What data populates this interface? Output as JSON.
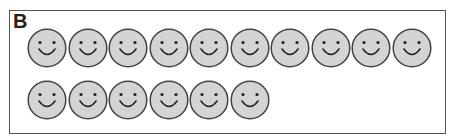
{
  "panel": {
    "label": "B",
    "rows": [
      {
        "count": 10
      },
      {
        "count": 6
      }
    ],
    "total": 16,
    "icon": "smiley-face-icon",
    "colors": {
      "face_fill": "#d4d4d4",
      "stroke": "#444444",
      "border": "#555555"
    }
  }
}
